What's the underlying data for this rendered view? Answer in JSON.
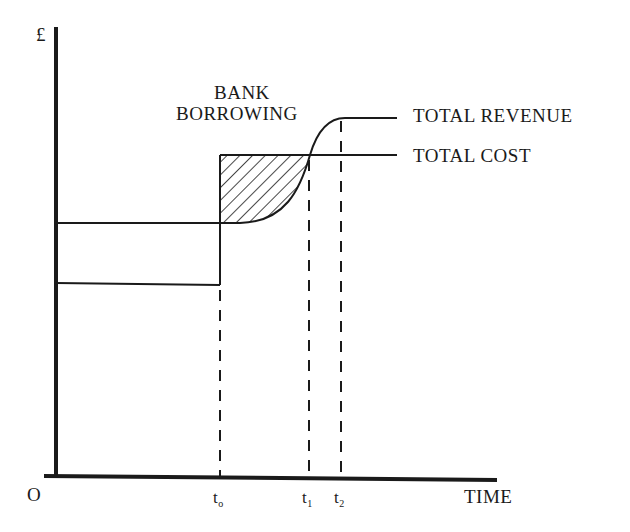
{
  "diagram": {
    "y_axis_label": "£",
    "x_axis_label": "TIME",
    "origin_label": "O",
    "annotation": {
      "line1": "BANK",
      "line2": "BORROWING"
    },
    "curves": {
      "revenue_label": "TOTAL REVENUE",
      "cost_label": "TOTAL COST"
    },
    "ticks": [
      {
        "base": "t",
        "sub": "o"
      },
      {
        "base": "t",
        "sub": "1"
      },
      {
        "base": "t",
        "sub": "2"
      }
    ],
    "colors": {
      "ink": "#1a1a1a",
      "background": "#ffffff"
    }
  }
}
